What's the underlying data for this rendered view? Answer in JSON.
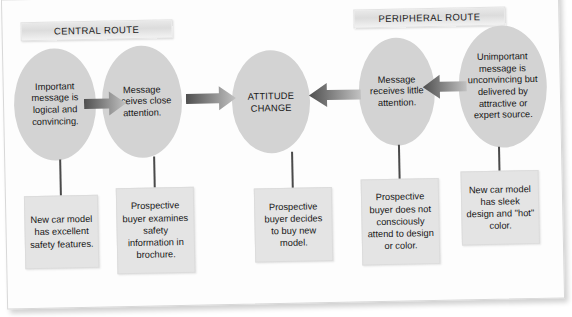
{
  "figure": {
    "title_central": "CENTRAL ROUTE",
    "title_peripheral": "PERIPHERAL ROUTE",
    "colors": {
      "ellipse_fill": "#d3d3d3",
      "box_fill": "#e4e4e4",
      "bar_fill": "#dcdcdc",
      "arrow_dark": "#575757",
      "arrow_light": "#bdbdbd",
      "text": "#171717",
      "page": "#fdfdfd"
    }
  },
  "nodes": [
    {
      "id": "central-source",
      "text": "Important message is logical and convincing."
    },
    {
      "id": "central-attention",
      "text": "Message receives close attention."
    },
    {
      "id": "outcome",
      "text": "ATTITUDE CHANGE"
    },
    {
      "id": "peripheral-attention",
      "text": "Message receives little attention."
    },
    {
      "id": "peripheral-source",
      "text": "Unimportant message is unconvincing but delivered by attractive or expert source."
    }
  ],
  "boxes": [
    {
      "id": "example-central-source",
      "text": "New car model has excellent safety features."
    },
    {
      "id": "example-central-attention",
      "text": "Prospective buyer examines safety information in brochure."
    },
    {
      "id": "example-outcome",
      "text": "Prospective buyer decides to buy new model."
    },
    {
      "id": "example-peripheral-attention",
      "text": "Prospective buyer does not consciously attend to design or color."
    },
    {
      "id": "example-peripheral-source",
      "text": "New car model has sleek design and \"hot\" color."
    }
  ],
  "arrows": [
    {
      "id": "arrow-central-1",
      "direction": "right"
    },
    {
      "id": "arrow-central-2",
      "direction": "right"
    },
    {
      "id": "arrow-peripheral-1",
      "direction": "left"
    },
    {
      "id": "arrow-peripheral-2",
      "direction": "left"
    }
  ]
}
